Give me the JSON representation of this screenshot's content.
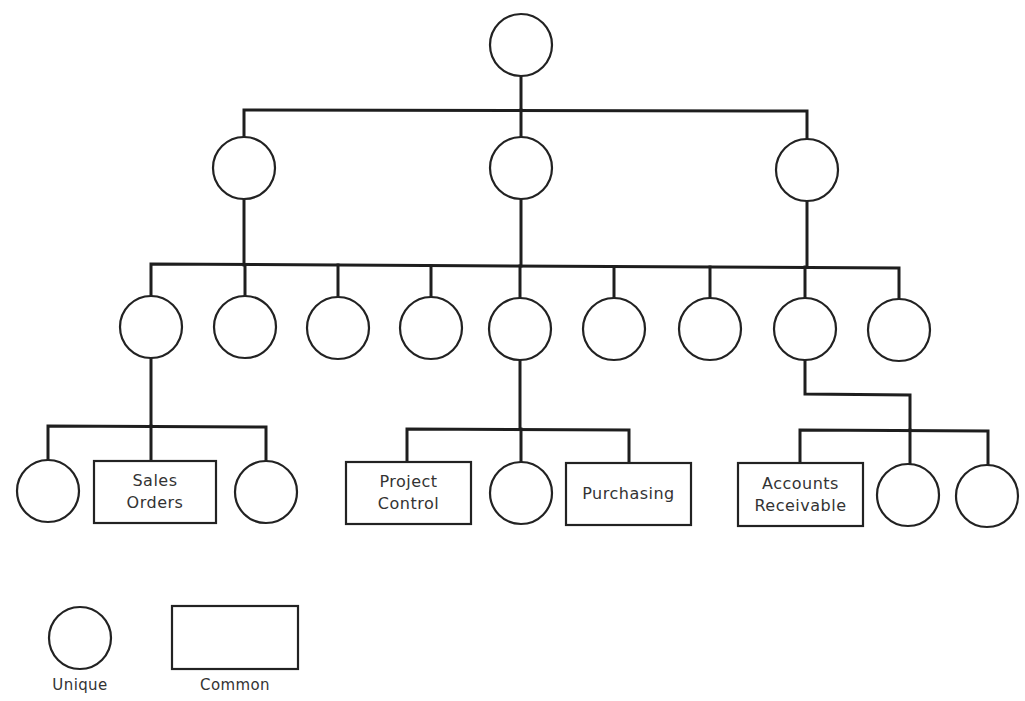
{
  "diagram": {
    "type": "hierarchy-tree",
    "colors": {
      "stroke": "#222222",
      "background": "#ffffff",
      "text": "#333333"
    },
    "nodes": [
      {
        "id": "root",
        "shape": "circle",
        "cx": 521,
        "cy": 45,
        "r": 31,
        "label": ""
      },
      {
        "id": "l1-a",
        "shape": "circle",
        "cx": 244,
        "cy": 168,
        "r": 31,
        "label": ""
      },
      {
        "id": "l1-b",
        "shape": "circle",
        "cx": 521,
        "cy": 168,
        "r": 31,
        "label": ""
      },
      {
        "id": "l1-c",
        "shape": "circle",
        "cx": 807,
        "cy": 170,
        "r": 31,
        "label": ""
      },
      {
        "id": "l2-1",
        "shape": "circle",
        "cx": 151,
        "cy": 327,
        "r": 31,
        "label": ""
      },
      {
        "id": "l2-2",
        "shape": "circle",
        "cx": 245,
        "cy": 327,
        "r": 31,
        "label": ""
      },
      {
        "id": "l2-3",
        "shape": "circle",
        "cx": 338,
        "cy": 328,
        "r": 31,
        "label": ""
      },
      {
        "id": "l2-4",
        "shape": "circle",
        "cx": 431,
        "cy": 328,
        "r": 31,
        "label": ""
      },
      {
        "id": "l2-5",
        "shape": "circle",
        "cx": 520,
        "cy": 329,
        "r": 31,
        "label": ""
      },
      {
        "id": "l2-6",
        "shape": "circle",
        "cx": 614,
        "cy": 329,
        "r": 31,
        "label": ""
      },
      {
        "id": "l2-7",
        "shape": "circle",
        "cx": 710,
        "cy": 329,
        "r": 31,
        "label": ""
      },
      {
        "id": "l2-8",
        "shape": "circle",
        "cx": 805,
        "cy": 329,
        "r": 31,
        "label": ""
      },
      {
        "id": "l2-9",
        "shape": "circle",
        "cx": 899,
        "cy": 330,
        "r": 31,
        "label": ""
      },
      {
        "id": "l3-a1",
        "shape": "circle",
        "cx": 48,
        "cy": 491,
        "r": 31,
        "label": ""
      },
      {
        "id": "l3-a2",
        "shape": "rect",
        "x": 94,
        "y": 461,
        "w": 122,
        "h": 62,
        "label": "Sales\nOrders"
      },
      {
        "id": "l3-a3",
        "shape": "circle",
        "cx": 266,
        "cy": 492,
        "r": 31,
        "label": ""
      },
      {
        "id": "l3-b1",
        "shape": "rect",
        "x": 346,
        "y": 462,
        "w": 125,
        "h": 62,
        "label": "Project\nControl"
      },
      {
        "id": "l3-b2",
        "shape": "circle",
        "cx": 521,
        "cy": 493,
        "r": 31,
        "label": ""
      },
      {
        "id": "l3-b3",
        "shape": "rect",
        "x": 566,
        "y": 463,
        "w": 125,
        "h": 62,
        "label": "Purchasing"
      },
      {
        "id": "l3-c1",
        "shape": "rect",
        "x": 738,
        "y": 463,
        "w": 125,
        "h": 63,
        "label": "Accounts\nReceivable"
      },
      {
        "id": "l3-c2",
        "shape": "circle",
        "cx": 908,
        "cy": 495,
        "r": 31,
        "label": ""
      },
      {
        "id": "l3-c3",
        "shape": "circle",
        "cx": 987,
        "cy": 496,
        "r": 31,
        "label": ""
      }
    ],
    "edges": [
      {
        "points": [
          [
            521,
            76
          ],
          [
            521,
            110
          ]
        ]
      },
      {
        "points": [
          [
            244,
            137
          ],
          [
            244,
            110
          ],
          [
            807,
            111
          ],
          [
            807,
            139
          ]
        ]
      },
      {
        "points": [
          [
            521,
            110
          ],
          [
            521,
            137
          ]
        ]
      },
      {
        "points": [
          [
            244,
            199
          ],
          [
            244,
            265
          ]
        ]
      },
      {
        "points": [
          [
            521,
            199
          ],
          [
            521,
            266
          ]
        ]
      },
      {
        "points": [
          [
            807,
            201
          ],
          [
            807,
            267
          ]
        ]
      },
      {
        "points": [
          [
            151,
            296
          ],
          [
            151,
            264
          ],
          [
            899,
            268
          ],
          [
            899,
            299
          ]
        ]
      },
      {
        "points": [
          [
            245,
            265
          ],
          [
            245,
            296
          ]
        ]
      },
      {
        "points": [
          [
            338,
            265
          ],
          [
            338,
            297
          ]
        ]
      },
      {
        "points": [
          [
            431,
            266
          ],
          [
            431,
            297
          ]
        ]
      },
      {
        "points": [
          [
            520,
            266
          ],
          [
            520,
            298
          ]
        ]
      },
      {
        "points": [
          [
            614,
            267
          ],
          [
            614,
            298
          ]
        ]
      },
      {
        "points": [
          [
            710,
            267
          ],
          [
            710,
            298
          ]
        ]
      },
      {
        "points": [
          [
            805,
            267
          ],
          [
            805,
            298
          ]
        ]
      },
      {
        "points": [
          [
            151,
            358
          ],
          [
            151,
            426
          ]
        ]
      },
      {
        "points": [
          [
            48,
            460
          ],
          [
            48,
            426
          ],
          [
            266,
            427
          ],
          [
            266,
            461
          ]
        ]
      },
      {
        "points": [
          [
            151,
            426
          ],
          [
            151,
            461
          ]
        ]
      },
      {
        "points": [
          [
            520,
            360
          ],
          [
            520,
            429
          ]
        ]
      },
      {
        "points": [
          [
            407,
            462
          ],
          [
            407,
            429
          ],
          [
            629,
            430
          ],
          [
            629,
            463
          ]
        ]
      },
      {
        "points": [
          [
            521,
            429
          ],
          [
            521,
            462
          ]
        ]
      },
      {
        "points": [
          [
            805,
            360
          ],
          [
            805,
            394
          ],
          [
            910,
            395
          ],
          [
            910,
            430
          ]
        ]
      },
      {
        "points": [
          [
            800,
            463
          ],
          [
            800,
            430
          ],
          [
            988,
            431
          ],
          [
            988,
            465
          ]
        ]
      },
      {
        "points": [
          [
            910,
            430
          ],
          [
            910,
            464
          ]
        ]
      }
    ]
  },
  "legend": {
    "items": [
      {
        "shape": "circle",
        "cx": 80,
        "cy": 638,
        "r": 31,
        "label": "Unique"
      },
      {
        "shape": "rect",
        "x": 172,
        "y": 606,
        "w": 126,
        "h": 63,
        "label": "Common"
      }
    ]
  }
}
